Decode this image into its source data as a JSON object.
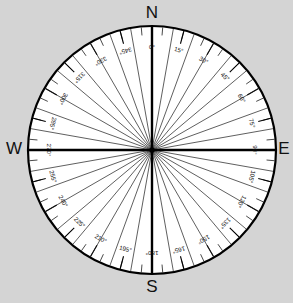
{
  "diagram": {
    "background_color": "#d4d4d4",
    "face_color": "#ffffff",
    "line_color": "#000000",
    "center": {
      "x": 152,
      "y": 150
    },
    "radius": 124
  },
  "cardinals": [
    {
      "key": "north",
      "label": "N",
      "bearing": 0,
      "x": 152,
      "y": 14
    },
    {
      "key": "east",
      "label": "E",
      "bearing": 90,
      "x": 284,
      "y": 150
    },
    {
      "key": "south",
      "label": "S",
      "bearing": 180,
      "x": 152,
      "y": 288
    },
    {
      "key": "west",
      "label": "W",
      "bearing": 270,
      "x": 14,
      "y": 150
    }
  ],
  "axes": [
    {
      "key": "north-south-axis",
      "from_bearing": 0,
      "to_bearing": 180
    },
    {
      "key": "west-east-axis",
      "from_bearing": 270,
      "to_bearing": 90
    }
  ],
  "chart_data": {
    "type": "polar-scale",
    "units": "degrees",
    "range": [
      0,
      360
    ],
    "label_interval": 15,
    "spoke_interval": 10,
    "minor_tick_interval": 5,
    "orientation": "north-up-clockwise",
    "labels": [
      {
        "degrees": 0,
        "text": "0°"
      },
      {
        "degrees": 15,
        "text": "15°"
      },
      {
        "degrees": 30,
        "text": "30°"
      },
      {
        "degrees": 45,
        "text": "45°"
      },
      {
        "degrees": 60,
        "text": "60°"
      },
      {
        "degrees": 75,
        "text": "75°"
      },
      {
        "degrees": 90,
        "text": "90°"
      },
      {
        "degrees": 105,
        "text": "105°"
      },
      {
        "degrees": 120,
        "text": "120°"
      },
      {
        "degrees": 135,
        "text": "135°"
      },
      {
        "degrees": 150,
        "text": "150°"
      },
      {
        "degrees": 165,
        "text": "165°"
      },
      {
        "degrees": 180,
        "text": "180°"
      },
      {
        "degrees": 195,
        "text": "195°"
      },
      {
        "degrees": 210,
        "text": "210°"
      },
      {
        "degrees": 225,
        "text": "225°"
      },
      {
        "degrees": 240,
        "text": "240°"
      },
      {
        "degrees": 255,
        "text": "255°"
      },
      {
        "degrees": 270,
        "text": "270°"
      },
      {
        "degrees": 285,
        "text": "285°"
      },
      {
        "degrees": 300,
        "text": "300°"
      },
      {
        "degrees": 315,
        "text": "315°"
      },
      {
        "degrees": 330,
        "text": "330°"
      },
      {
        "degrees": 345,
        "text": "345°"
      }
    ]
  }
}
